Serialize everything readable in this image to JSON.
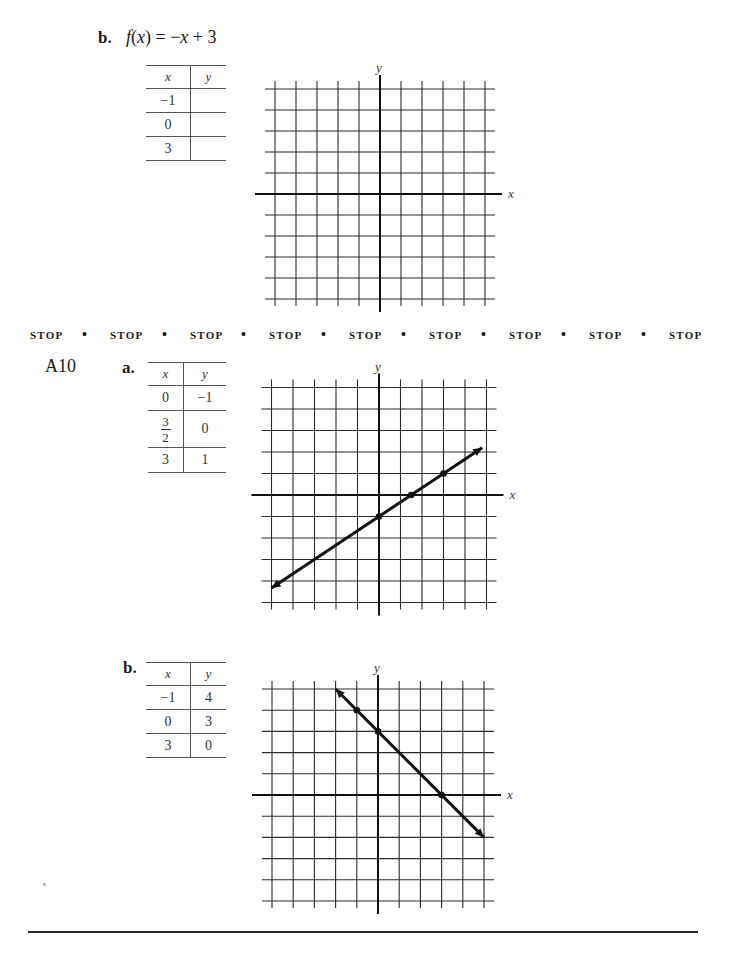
{
  "problem_b_prompt": {
    "part_label": "b.",
    "function": "f(x) = −x + 3",
    "table": {
      "headers": [
        "x",
        "y"
      ],
      "rows": [
        [
          "−1",
          ""
        ],
        [
          "0",
          ""
        ],
        [
          "3",
          ""
        ]
      ]
    },
    "graph": {
      "x_label": "x",
      "y_label": "y"
    }
  },
  "stop_banner": {
    "words": [
      "STOP",
      "STOP",
      "STOP",
      "STOP",
      "STOP",
      "STOP",
      "STOP",
      "STOP",
      "STOP"
    ],
    "separator": "•"
  },
  "answers": {
    "problem_number": "A10",
    "part_a": {
      "part_label": "a.",
      "table": {
        "headers": [
          "x",
          "y"
        ],
        "rows": [
          [
            "0",
            "−1"
          ],
          [
            "3/2",
            "0"
          ],
          [
            "3",
            "1"
          ]
        ],
        "fraction_row": {
          "numerator": "3",
          "denominator": "2"
        }
      },
      "graph": {
        "x_label": "x",
        "y_label": "y"
      }
    },
    "part_b": {
      "part_label": "b.",
      "table": {
        "headers": [
          "x",
          "y"
        ],
        "rows": [
          [
            "−1",
            "4"
          ],
          [
            "0",
            "3"
          ],
          [
            "3",
            "0"
          ]
        ]
      },
      "graph": {
        "x_label": "x",
        "y_label": "y"
      }
    }
  },
  "chart_data": [
    {
      "type": "line",
      "title": "f(x) = -x + 3 (blank grid)",
      "xlabel": "x",
      "ylabel": "y",
      "xlim": [
        -5,
        5
      ],
      "ylim": [
        -5,
        5
      ],
      "grid": true,
      "series": []
    },
    {
      "type": "line",
      "title": "A10 a. answer",
      "xlabel": "x",
      "ylabel": "y",
      "xlim": [
        -5,
        5
      ],
      "ylim": [
        -5,
        5
      ],
      "grid": true,
      "series": [
        {
          "name": "y = (2/3)x - 1",
          "points": [
            [
              0,
              -1
            ],
            [
              1.5,
              0
            ],
            [
              3,
              1
            ]
          ],
          "line_from": [
            -5,
            -4.33
          ],
          "line_to": [
            4.8,
            2.2
          ],
          "arrows": "both"
        }
      ]
    },
    {
      "type": "line",
      "title": "A10 b. answer",
      "xlabel": "x",
      "ylabel": "y",
      "xlim": [
        -5,
        5
      ],
      "ylim": [
        -5,
        5
      ],
      "grid": true,
      "series": [
        {
          "name": "y = -x + 3",
          "points": [
            [
              -1,
              4
            ],
            [
              0,
              3
            ],
            [
              3,
              0
            ]
          ],
          "line_from": [
            -2,
            5
          ],
          "line_to": [
            5,
            -2
          ],
          "arrows": "both"
        }
      ]
    }
  ]
}
